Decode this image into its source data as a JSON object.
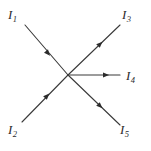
{
  "figure": {
    "type": "current-junction-diagram",
    "width": 151,
    "height": 151,
    "background_color": "#ffffff",
    "line_color": "#3a3a3a",
    "label_color": "#2b2b2b",
    "junction": {
      "x": 68,
      "y": 75
    }
  },
  "labels": {
    "I1": {
      "symbol": "I",
      "subscript": "1"
    },
    "I2": {
      "symbol": "I",
      "subscript": "2"
    },
    "I3": {
      "symbol": "I",
      "subscript": "3"
    },
    "I4": {
      "symbol": "I",
      "subscript": "4"
    },
    "I5": {
      "symbol": "I",
      "subscript": "5"
    }
  },
  "branches": [
    {
      "id": "I1",
      "label": "I1",
      "direction": "into-junction",
      "outer_point": {
        "x": 25,
        "y": 25
      },
      "arrow_at": {
        "x": 46,
        "y": 51
      },
      "arrow_angle_deg": 51
    },
    {
      "id": "I2",
      "label": "I2",
      "direction": "into-junction",
      "outer_point": {
        "x": 22,
        "y": 122
      },
      "arrow_at": {
        "x": 45,
        "y": 98
      },
      "arrow_angle_deg": -46
    },
    {
      "id": "I3",
      "label": "I3",
      "direction": "out-of-junction",
      "outer_point": {
        "x": 120,
        "y": 25
      },
      "arrow_at": {
        "x": 98,
        "y": 48
      },
      "arrow_angle_deg": -45
    },
    {
      "id": "I4",
      "label": "I4",
      "direction": "out-of-junction",
      "outer_point": {
        "x": 120,
        "y": 75
      },
      "arrow_at": {
        "x": 103,
        "y": 75
      },
      "arrow_angle_deg": 0
    },
    {
      "id": "I5",
      "label": "I5",
      "direction": "out-of-junction",
      "outer_point": {
        "x": 120,
        "y": 125
      },
      "arrow_at": {
        "x": 98,
        "y": 102
      },
      "arrow_angle_deg": 45
    }
  ]
}
